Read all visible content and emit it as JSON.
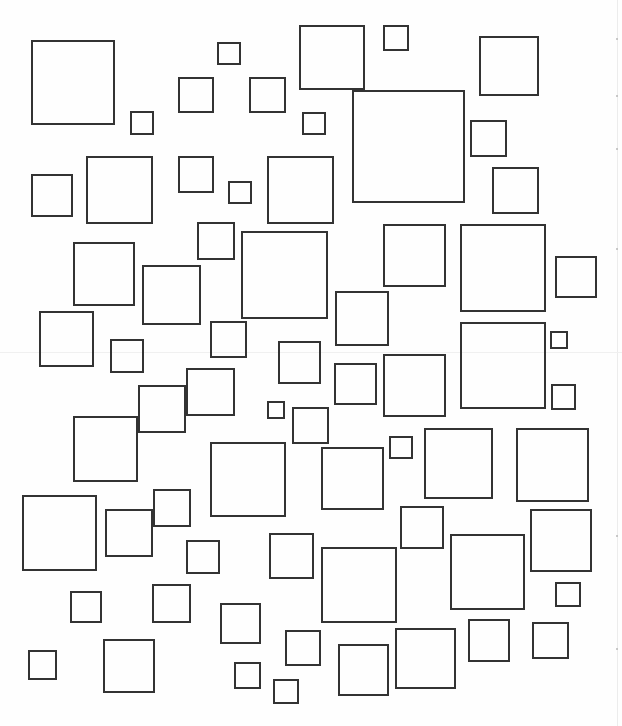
{
  "figure": {
    "stroke_color": "#333333",
    "background_color": "#ffffff",
    "width": 622,
    "height": 726
  },
  "squares": [
    {
      "x": 31,
      "y": 40,
      "w": 84,
      "h": 85
    },
    {
      "x": 130,
      "y": 111,
      "w": 24,
      "h": 24
    },
    {
      "x": 178,
      "y": 77,
      "w": 36,
      "h": 36
    },
    {
      "x": 217,
      "y": 42,
      "w": 24,
      "h": 23
    },
    {
      "x": 249,
      "y": 77,
      "w": 37,
      "h": 36
    },
    {
      "x": 299,
      "y": 25,
      "w": 66,
      "h": 65
    },
    {
      "x": 383,
      "y": 25,
      "w": 26,
      "h": 26
    },
    {
      "x": 479,
      "y": 36,
      "w": 60,
      "h": 60
    },
    {
      "x": 352,
      "y": 90,
      "w": 113,
      "h": 113
    },
    {
      "x": 302,
      "y": 112,
      "w": 24,
      "h": 23
    },
    {
      "x": 470,
      "y": 120,
      "w": 37,
      "h": 37
    },
    {
      "x": 492,
      "y": 167,
      "w": 47,
      "h": 47
    },
    {
      "x": 31,
      "y": 174,
      "w": 42,
      "h": 43
    },
    {
      "x": 86,
      "y": 156,
      "w": 67,
      "h": 68
    },
    {
      "x": 178,
      "y": 156,
      "w": 36,
      "h": 37
    },
    {
      "x": 228,
      "y": 181,
      "w": 24,
      "h": 23
    },
    {
      "x": 267,
      "y": 156,
      "w": 67,
      "h": 68
    },
    {
      "x": 73,
      "y": 242,
      "w": 62,
      "h": 64
    },
    {
      "x": 142,
      "y": 265,
      "w": 59,
      "h": 60
    },
    {
      "x": 197,
      "y": 222,
      "w": 38,
      "h": 38
    },
    {
      "x": 241,
      "y": 231,
      "w": 87,
      "h": 88
    },
    {
      "x": 39,
      "y": 311,
      "w": 55,
      "h": 56
    },
    {
      "x": 110,
      "y": 339,
      "w": 34,
      "h": 34
    },
    {
      "x": 210,
      "y": 321,
      "w": 37,
      "h": 37
    },
    {
      "x": 186,
      "y": 368,
      "w": 49,
      "h": 48
    },
    {
      "x": 138,
      "y": 385,
      "w": 48,
      "h": 48
    },
    {
      "x": 73,
      "y": 416,
      "w": 65,
      "h": 66
    },
    {
      "x": 278,
      "y": 341,
      "w": 43,
      "h": 43
    },
    {
      "x": 267,
      "y": 401,
      "w": 18,
      "h": 18
    },
    {
      "x": 292,
      "y": 407,
      "w": 37,
      "h": 37
    },
    {
      "x": 210,
      "y": 442,
      "w": 76,
      "h": 75
    },
    {
      "x": 383,
      "y": 224,
      "w": 63,
      "h": 63
    },
    {
      "x": 460,
      "y": 224,
      "w": 86,
      "h": 88
    },
    {
      "x": 555,
      "y": 256,
      "w": 42,
      "h": 42
    },
    {
      "x": 335,
      "y": 291,
      "w": 54,
      "h": 55
    },
    {
      "x": 460,
      "y": 322,
      "w": 86,
      "h": 87
    },
    {
      "x": 550,
      "y": 331,
      "w": 18,
      "h": 18
    },
    {
      "x": 334,
      "y": 363,
      "w": 43,
      "h": 42
    },
    {
      "x": 383,
      "y": 354,
      "w": 63,
      "h": 63
    },
    {
      "x": 551,
      "y": 384,
      "w": 25,
      "h": 26
    },
    {
      "x": 389,
      "y": 436,
      "w": 24,
      "h": 23
    },
    {
      "x": 424,
      "y": 428,
      "w": 69,
      "h": 71
    },
    {
      "x": 516,
      "y": 428,
      "w": 73,
      "h": 74
    },
    {
      "x": 321,
      "y": 447,
      "w": 63,
      "h": 63
    },
    {
      "x": 22,
      "y": 495,
      "w": 75,
      "h": 76
    },
    {
      "x": 105,
      "y": 509,
      "w": 48,
      "h": 48
    },
    {
      "x": 153,
      "y": 489,
      "w": 38,
      "h": 38
    },
    {
      "x": 186,
      "y": 540,
      "w": 34,
      "h": 34
    },
    {
      "x": 269,
      "y": 533,
      "w": 45,
      "h": 46
    },
    {
      "x": 70,
      "y": 591,
      "w": 32,
      "h": 32
    },
    {
      "x": 152,
      "y": 584,
      "w": 39,
      "h": 39
    },
    {
      "x": 220,
      "y": 603,
      "w": 41,
      "h": 41
    },
    {
      "x": 28,
      "y": 650,
      "w": 29,
      "h": 30
    },
    {
      "x": 103,
      "y": 639,
      "w": 52,
      "h": 54
    },
    {
      "x": 234,
      "y": 662,
      "w": 27,
      "h": 27
    },
    {
      "x": 273,
      "y": 679,
      "w": 26,
      "h": 25
    },
    {
      "x": 285,
      "y": 630,
      "w": 36,
      "h": 36
    },
    {
      "x": 400,
      "y": 506,
      "w": 44,
      "h": 43
    },
    {
      "x": 321,
      "y": 547,
      "w": 76,
      "h": 76
    },
    {
      "x": 450,
      "y": 534,
      "w": 75,
      "h": 76
    },
    {
      "x": 530,
      "y": 509,
      "w": 62,
      "h": 63
    },
    {
      "x": 555,
      "y": 582,
      "w": 26,
      "h": 25
    },
    {
      "x": 338,
      "y": 644,
      "w": 51,
      "h": 52
    },
    {
      "x": 395,
      "y": 628,
      "w": 61,
      "h": 61
    },
    {
      "x": 468,
      "y": 619,
      "w": 42,
      "h": 43
    },
    {
      "x": 532,
      "y": 622,
      "w": 37,
      "h": 37
    }
  ],
  "artifacts": {
    "vertical_scan_line_x": 617,
    "horizontal_scan_line_y": 352,
    "dots": [
      {
        "x": 616,
        "y": 38
      },
      {
        "x": 616,
        "y": 95
      },
      {
        "x": 616,
        "y": 148
      },
      {
        "x": 616,
        "y": 248
      },
      {
        "x": 616,
        "y": 535
      },
      {
        "x": 616,
        "y": 648
      }
    ]
  }
}
